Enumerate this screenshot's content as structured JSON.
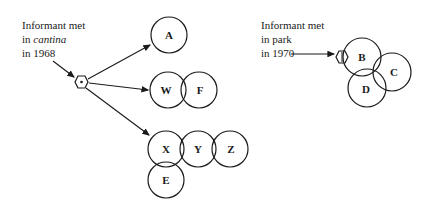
{
  "diagram": {
    "left": {
      "caption": [
        "Informant met",
        "in ",
        "cantina",
        "in 1968"
      ],
      "line1": "Informant met",
      "line2_prefix": "in ",
      "line2_italic": "cantina",
      "line3": "in 1968",
      "nodes": {
        "A": "A",
        "W": "W",
        "F": "F",
        "X": "X",
        "Y": "Y",
        "Z": "Z",
        "E": "E"
      }
    },
    "right": {
      "line1": "Informant met",
      "line2": "in park",
      "line3": "in 1970",
      "nodes": {
        "B": "B",
        "C": "C",
        "D": "D"
      }
    },
    "colors": {
      "ink": "#1a1a1a",
      "background": "#ffffff"
    }
  }
}
